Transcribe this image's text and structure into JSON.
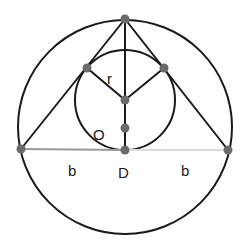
{
  "diagram": {
    "colors": {
      "stroke": "#1a1a1a",
      "point": "#6b6b6b",
      "base_left": "#9a9a9a",
      "base_right": "#dcdcdc"
    },
    "outer_circle": {
      "cx": 125,
      "cy": 127,
      "r": 107
    },
    "inner_circle": {
      "cx": 125,
      "cy": 100,
      "r": 50
    },
    "points": {
      "apex": {
        "x": 125,
        "y": 19
      },
      "left": {
        "x": 21,
        "y": 149
      },
      "right": {
        "x": 228,
        "y": 150
      },
      "tangent_left": {
        "x": 87,
        "y": 68
      },
      "tangent_right": {
        "x": 164,
        "y": 68
      },
      "incenter": {
        "x": 125,
        "y": 100
      },
      "mid": {
        "x": 125,
        "y": 128
      },
      "D": {
        "x": 125,
        "y": 150
      }
    },
    "labels": {
      "r": "r",
      "O": "O",
      "D": "D",
      "b_left": "b",
      "b_right": "b"
    }
  }
}
